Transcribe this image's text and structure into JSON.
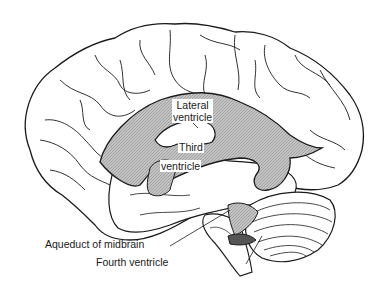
{
  "diagram": {
    "colors": {
      "outline": "#1a1a1a",
      "ventricle_fill": "#b8b8b8",
      "background": "#ffffff"
    },
    "labels": {
      "lateral_ventricle": {
        "line1": "Lateral",
        "line2": "ventricle"
      },
      "third_ventricle": {
        "line1": "Third",
        "line2": "ventricle"
      },
      "aqueduct": "Aqueduct of midbrain",
      "fourth_ventricle": "Fourth ventricle"
    }
  }
}
